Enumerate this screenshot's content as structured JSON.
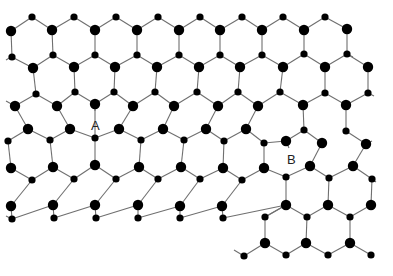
{
  "figure": {
    "type": "hexagonal-lattice-with-dislocations",
    "width": 393,
    "height": 276,
    "background": "#ffffff",
    "bond_color": "#6f6f6f",
    "atom_color": "#000000",
    "atom_radius_large": 5.2,
    "atom_radius_small": 3.6
  },
  "labels": [
    {
      "id": "A",
      "text": "A",
      "x": 91,
      "y": 130
    },
    {
      "id": "B",
      "text": "B",
      "x": 287,
      "y": 164
    }
  ],
  "atoms": [
    {
      "id": "r0a",
      "x": 32,
      "y": 17,
      "size": "small"
    },
    {
      "id": "r0b",
      "x": 74,
      "y": 17,
      "size": "small"
    },
    {
      "id": "r0c",
      "x": 116,
      "y": 17,
      "size": "small"
    },
    {
      "id": "r0d",
      "x": 158,
      "y": 17,
      "size": "small"
    },
    {
      "id": "r0e",
      "x": 200,
      "y": 17,
      "size": "small"
    },
    {
      "id": "r0f",
      "x": 242,
      "y": 17,
      "size": "small"
    },
    {
      "id": "r0g",
      "x": 283,
      "y": 17,
      "size": "small"
    },
    {
      "id": "r0h",
      "x": 325,
      "y": 17,
      "size": "small"
    },
    {
      "id": "r1a",
      "x": 11,
      "y": 31,
      "size": "large"
    },
    {
      "id": "r1b",
      "x": 52,
      "y": 30,
      "size": "large"
    },
    {
      "id": "r1c",
      "x": 95,
      "y": 30,
      "size": "large"
    },
    {
      "id": "r1d",
      "x": 137,
      "y": 30,
      "size": "large"
    },
    {
      "id": "r1e",
      "x": 179,
      "y": 30,
      "size": "large"
    },
    {
      "id": "r1f",
      "x": 220,
      "y": 30,
      "size": "large"
    },
    {
      "id": "r1g",
      "x": 262,
      "y": 30,
      "size": "large"
    },
    {
      "id": "r1h",
      "x": 304,
      "y": 30,
      "size": "large"
    },
    {
      "id": "r1i",
      "x": 347,
      "y": 29,
      "size": "large"
    },
    {
      "id": "r2a",
      "x": 12,
      "y": 57,
      "size": "small"
    },
    {
      "id": "r2b",
      "x": 53,
      "y": 55,
      "size": "small"
    },
    {
      "id": "r2c",
      "x": 95,
      "y": 55,
      "size": "small"
    },
    {
      "id": "r2d",
      "x": 137,
      "y": 55,
      "size": "small"
    },
    {
      "id": "r2e",
      "x": 179,
      "y": 55,
      "size": "small"
    },
    {
      "id": "r2f",
      "x": 220,
      "y": 55,
      "size": "small"
    },
    {
      "id": "r2g",
      "x": 262,
      "y": 55,
      "size": "small"
    },
    {
      "id": "r2h",
      "x": 304,
      "y": 54,
      "size": "small"
    },
    {
      "id": "r2i",
      "x": 347,
      "y": 54,
      "size": "small"
    },
    {
      "id": "r3a",
      "x": 33,
      "y": 68,
      "size": "large"
    },
    {
      "id": "r3b",
      "x": 74,
      "y": 67,
      "size": "large"
    },
    {
      "id": "r3c",
      "x": 115,
      "y": 67,
      "size": "large"
    },
    {
      "id": "r3d",
      "x": 157,
      "y": 67,
      "size": "large"
    },
    {
      "id": "r3e",
      "x": 199,
      "y": 67,
      "size": "large"
    },
    {
      "id": "r3f",
      "x": 240,
      "y": 67,
      "size": "large"
    },
    {
      "id": "r3g",
      "x": 283,
      "y": 67,
      "size": "large"
    },
    {
      "id": "r3h",
      "x": 325,
      "y": 67,
      "size": "large"
    },
    {
      "id": "r3i",
      "x": 368,
      "y": 67,
      "size": "large"
    },
    {
      "id": "r4a",
      "x": 36,
      "y": 94,
      "size": "small"
    },
    {
      "id": "r4b",
      "x": 75,
      "y": 92,
      "size": "small"
    },
    {
      "id": "r4c",
      "x": 114,
      "y": 92,
      "size": "small"
    },
    {
      "id": "r4d",
      "x": 155,
      "y": 92,
      "size": "small"
    },
    {
      "id": "r4e",
      "x": 197,
      "y": 92,
      "size": "small"
    },
    {
      "id": "r4f",
      "x": 238,
      "y": 92,
      "size": "small"
    },
    {
      "id": "r4g",
      "x": 280,
      "y": 92,
      "size": "small"
    },
    {
      "id": "r4h",
      "x": 325,
      "y": 93,
      "size": "small"
    },
    {
      "id": "r4i",
      "x": 368,
      "y": 93,
      "size": "small"
    },
    {
      "id": "r5a",
      "x": 15,
      "y": 106,
      "size": "large"
    },
    {
      "id": "r5b",
      "x": 57,
      "y": 106,
      "size": "large"
    },
    {
      "id": "r5c",
      "x": 95,
      "y": 104,
      "size": "large"
    },
    {
      "id": "r5d",
      "x": 133,
      "y": 106,
      "size": "large"
    },
    {
      "id": "r5e",
      "x": 174,
      "y": 106,
      "size": "large"
    },
    {
      "id": "r5f",
      "x": 218,
      "y": 106,
      "size": "large"
    },
    {
      "id": "r5g",
      "x": 258,
      "y": 106,
      "size": "large"
    },
    {
      "id": "r5h",
      "x": 303,
      "y": 105,
      "size": "large"
    },
    {
      "id": "r5i",
      "x": 346,
      "y": 105,
      "size": "large"
    },
    {
      "id": "r6a",
      "x": 8,
      "y": 141,
      "size": "small"
    },
    {
      "id": "r6b",
      "x": 50,
      "y": 140,
      "size": "small"
    },
    {
      "id": "r6c",
      "x": 95,
      "y": 138,
      "size": "small"
    },
    {
      "id": "r6d",
      "x": 141,
      "y": 140,
      "size": "small"
    },
    {
      "id": "r6e",
      "x": 184,
      "y": 140,
      "size": "small"
    },
    {
      "id": "r6f",
      "x": 224,
      "y": 141,
      "size": "small"
    },
    {
      "id": "r6g",
      "x": 264,
      "y": 143,
      "size": "small"
    },
    {
      "id": "r6h",
      "x": 304,
      "y": 130,
      "size": "small"
    },
    {
      "id": "r6i",
      "x": 346,
      "y": 131,
      "size": "small"
    },
    {
      "id": "r7a",
      "x": 28,
      "y": 129,
      "size": "large"
    },
    {
      "id": "r7b",
      "x": 70,
      "y": 129,
      "size": "large"
    },
    {
      "id": "r7c",
      "x": 119,
      "y": 129,
      "size": "large"
    },
    {
      "id": "r7d",
      "x": 163,
      "y": 129,
      "size": "large"
    },
    {
      "id": "r7e",
      "x": 206,
      "y": 129,
      "size": "large"
    },
    {
      "id": "r7f",
      "x": 246,
      "y": 129,
      "size": "large"
    },
    {
      "id": "r7g",
      "x": 286,
      "y": 141,
      "size": "large"
    },
    {
      "id": "r7h",
      "x": 322,
      "y": 143,
      "size": "large"
    },
    {
      "id": "r7i",
      "x": 366,
      "y": 144,
      "size": "large"
    },
    {
      "id": "r8a",
      "x": 11,
      "y": 168,
      "size": "large"
    },
    {
      "id": "r8b",
      "x": 53,
      "y": 167,
      "size": "large"
    },
    {
      "id": "r8c",
      "x": 95,
      "y": 165,
      "size": "large"
    },
    {
      "id": "r8d",
      "x": 139,
      "y": 167,
      "size": "large"
    },
    {
      "id": "r8e",
      "x": 181,
      "y": 167,
      "size": "large"
    },
    {
      "id": "r8f",
      "x": 223,
      "y": 168,
      "size": "large"
    },
    {
      "id": "r8g",
      "x": 264,
      "y": 168,
      "size": "large"
    },
    {
      "id": "r8h",
      "x": 310,
      "y": 166,
      "size": "large"
    },
    {
      "id": "r8i",
      "x": 353,
      "y": 166,
      "size": "large"
    },
    {
      "id": "r9a",
      "x": 32,
      "y": 180,
      "size": "small"
    },
    {
      "id": "r9b",
      "x": 74,
      "y": 179,
      "size": "small"
    },
    {
      "id": "r9c",
      "x": 116,
      "y": 179,
      "size": "small"
    },
    {
      "id": "r9d",
      "x": 158,
      "y": 179,
      "size": "small"
    },
    {
      "id": "r9e",
      "x": 200,
      "y": 179,
      "size": "small"
    },
    {
      "id": "r9f",
      "x": 242,
      "y": 180,
      "size": "small"
    },
    {
      "id": "r9g",
      "x": 286,
      "y": 177,
      "size": "small"
    },
    {
      "id": "r9h",
      "x": 329,
      "y": 178,
      "size": "small"
    },
    {
      "id": "r9i",
      "x": 372,
      "y": 179,
      "size": "small"
    },
    {
      "id": "r10a",
      "x": 11,
      "y": 206,
      "size": "large"
    },
    {
      "id": "r10b",
      "x": 53,
      "y": 205,
      "size": "large"
    },
    {
      "id": "r10c",
      "x": 95,
      "y": 205,
      "size": "large"
    },
    {
      "id": "r10d",
      "x": 138,
      "y": 205,
      "size": "large"
    },
    {
      "id": "r10e",
      "x": 180,
      "y": 206,
      "size": "large"
    },
    {
      "id": "r10f",
      "x": 222,
      "y": 206,
      "size": "large"
    },
    {
      "id": "r10g",
      "x": 286,
      "y": 205,
      "size": "large"
    },
    {
      "id": "r10h",
      "x": 328,
      "y": 205,
      "size": "large"
    },
    {
      "id": "r10i",
      "x": 371,
      "y": 205,
      "size": "large"
    },
    {
      "id": "r11a",
      "x": 12,
      "y": 219,
      "size": "small"
    },
    {
      "id": "r11b",
      "x": 54,
      "y": 218,
      "size": "small"
    },
    {
      "id": "r11c",
      "x": 96,
      "y": 218,
      "size": "small"
    },
    {
      "id": "r11d",
      "x": 138,
      "y": 218,
      "size": "small"
    },
    {
      "id": "r11e",
      "x": 180,
      "y": 218,
      "size": "small"
    },
    {
      "id": "r11f",
      "x": 223,
      "y": 218,
      "size": "small"
    },
    {
      "id": "r11g",
      "x": 265,
      "y": 217,
      "size": "small"
    },
    {
      "id": "r11h",
      "x": 307,
      "y": 217,
      "size": "small"
    },
    {
      "id": "r11i",
      "x": 350,
      "y": 217,
      "size": "small"
    },
    {
      "id": "r12a",
      "x": 265,
      "y": 243,
      "size": "large"
    },
    {
      "id": "r12b",
      "x": 306,
      "y": 243,
      "size": "large"
    },
    {
      "id": "r12c",
      "x": 350,
      "y": 243,
      "size": "large"
    },
    {
      "id": "r13a",
      "x": 244,
      "y": 256,
      "size": "small"
    },
    {
      "id": "r13b",
      "x": 286,
      "y": 255,
      "size": "small"
    },
    {
      "id": "r13c",
      "x": 328,
      "y": 255,
      "size": "small"
    },
    {
      "id": "r13d",
      "x": 371,
      "y": 255,
      "size": "small"
    }
  ],
  "bonds": [
    [
      "r1a",
      "r0a"
    ],
    [
      "r0a",
      "r1b"
    ],
    [
      "r1b",
      "r0b"
    ],
    [
      "r0b",
      "r1c"
    ],
    [
      "r1c",
      "r0c"
    ],
    [
      "r0c",
      "r1d"
    ],
    [
      "r1d",
      "r0d"
    ],
    [
      "r0d",
      "r1e"
    ],
    [
      "r1e",
      "r0e"
    ],
    [
      "r0e",
      "r1f"
    ],
    [
      "r1f",
      "r0f"
    ],
    [
      "r0f",
      "r1g"
    ],
    [
      "r1g",
      "r0g"
    ],
    [
      "r0g",
      "r1h"
    ],
    [
      "r1h",
      "r0h"
    ],
    [
      "r0h",
      "r1i"
    ],
    [
      "r1a",
      "r2a"
    ],
    [
      "r1b",
      "r2b"
    ],
    [
      "r1c",
      "r2c"
    ],
    [
      "r1d",
      "r2d"
    ],
    [
      "r1e",
      "r2e"
    ],
    [
      "r1f",
      "r2f"
    ],
    [
      "r1g",
      "r2g"
    ],
    [
      "r1h",
      "r2h"
    ],
    [
      "r1i",
      "r2i"
    ],
    [
      "r2a",
      "r3a"
    ],
    [
      "r3a",
      "r2b"
    ],
    [
      "r2b",
      "r3b"
    ],
    [
      "r3b",
      "r2c"
    ],
    [
      "r2c",
      "r3c"
    ],
    [
      "r3c",
      "r2d"
    ],
    [
      "r2d",
      "r3d"
    ],
    [
      "r3d",
      "r2e"
    ],
    [
      "r2e",
      "r3e"
    ],
    [
      "r3e",
      "r2f"
    ],
    [
      "r2f",
      "r3f"
    ],
    [
      "r3f",
      "r2g"
    ],
    [
      "r2g",
      "r3g"
    ],
    [
      "r3g",
      "r2h"
    ],
    [
      "r2h",
      "r3h"
    ],
    [
      "r3h",
      "r2i"
    ],
    [
      "r2i",
      "r3i"
    ],
    [
      "r3a",
      "r4a"
    ],
    [
      "r3b",
      "r4b"
    ],
    [
      "r3c",
      "r4c"
    ],
    [
      "r3d",
      "r4d"
    ],
    [
      "r3e",
      "r4e"
    ],
    [
      "r3f",
      "r4f"
    ],
    [
      "r3g",
      "r4g"
    ],
    [
      "r3h",
      "r4h"
    ],
    [
      "r3i",
      "r4i"
    ],
    [
      "r5a",
      "r4a"
    ],
    [
      "r4a",
      "r5b"
    ],
    [
      "r5b",
      "r4b"
    ],
    [
      "r4b",
      "r5c"
    ],
    [
      "r5c",
      "r4c"
    ],
    [
      "r4c",
      "r5d"
    ],
    [
      "r5d",
      "r4d"
    ],
    [
      "r4d",
      "r5e"
    ],
    [
      "r5e",
      "r4e"
    ],
    [
      "r4e",
      "r5f"
    ],
    [
      "r5f",
      "r4f"
    ],
    [
      "r4f",
      "r5g"
    ],
    [
      "r5g",
      "r4g"
    ],
    [
      "r4g",
      "r5h"
    ],
    [
      "r5h",
      "r4h"
    ],
    [
      "r4h",
      "r5i"
    ],
    [
      "r5i",
      "r4i"
    ],
    [
      "r5a",
      "r7a"
    ],
    [
      "r5b",
      "r7b"
    ],
    [
      "r5d",
      "r7c"
    ],
    [
      "r5e",
      "r7d"
    ],
    [
      "r5f",
      "r7e"
    ],
    [
      "r5g",
      "r7f"
    ],
    [
      "r5h",
      "r6h"
    ],
    [
      "r5i",
      "r6i"
    ],
    [
      "r5c",
      "r6c"
    ],
    [
      "r6a",
      "r7a"
    ],
    [
      "r7a",
      "r6b"
    ],
    [
      "r6b",
      "r7b"
    ],
    [
      "r7b",
      "r6c"
    ],
    [
      "r6c",
      "r7c"
    ],
    [
      "r7c",
      "r6d"
    ],
    [
      "r6d",
      "r7d"
    ],
    [
      "r7d",
      "r6e"
    ],
    [
      "r6e",
      "r7e"
    ],
    [
      "r7e",
      "r6f"
    ],
    [
      "r6f",
      "r7f"
    ],
    [
      "r7f",
      "r6g"
    ],
    [
      "r6g",
      "r7g"
    ],
    [
      "r6h",
      "r7h"
    ],
    [
      "r6i",
      "r7i"
    ],
    [
      "r6h",
      "r7g"
    ],
    [
      "r6a",
      "r8a"
    ],
    [
      "r6b",
      "r8b"
    ],
    [
      "r6c",
      "r8c"
    ],
    [
      "r6d",
      "r8d"
    ],
    [
      "r6e",
      "r8e"
    ],
    [
      "r6f",
      "r8f"
    ],
    [
      "r6g",
      "r8g"
    ],
    [
      "r7h",
      "r8h"
    ],
    [
      "r7i",
      "r8i"
    ],
    [
      "r8a",
      "r9a"
    ],
    [
      "r9a",
      "r8b"
    ],
    [
      "r8b",
      "r9b"
    ],
    [
      "r9b",
      "r8c"
    ],
    [
      "r8c",
      "r9c"
    ],
    [
      "r9c",
      "r8d"
    ],
    [
      "r8d",
      "r9d"
    ],
    [
      "r9d",
      "r8e"
    ],
    [
      "r8e",
      "r9e"
    ],
    [
      "r9e",
      "r8f"
    ],
    [
      "r8f",
      "r9f"
    ],
    [
      "r9f",
      "r8g"
    ],
    [
      "r8g",
      "r9g"
    ],
    [
      "r9g",
      "r8h"
    ],
    [
      "r8h",
      "r9h"
    ],
    [
      "r9h",
      "r8i"
    ],
    [
      "r8i",
      "r9i"
    ],
    [
      "r9a",
      "r10a"
    ],
    [
      "r9b",
      "r10b"
    ],
    [
      "r9c",
      "r10c"
    ],
    [
      "r9d",
      "r10d"
    ],
    [
      "r9e",
      "r10e"
    ],
    [
      "r9f",
      "r10f"
    ],
    [
      "r9g",
      "r10g"
    ],
    [
      "r9h",
      "r10h"
    ],
    [
      "r9i",
      "r10i"
    ],
    [
      "r10a",
      "r11a"
    ],
    [
      "r11a",
      "r10b"
    ],
    [
      "r10b",
      "r11b"
    ],
    [
      "r11b",
      "r10c"
    ],
    [
      "r10c",
      "r11c"
    ],
    [
      "r11c",
      "r10d"
    ],
    [
      "r10d",
      "r11d"
    ],
    [
      "r11d",
      "r10e"
    ],
    [
      "r10e",
      "r11e"
    ],
    [
      "r11e",
      "r10f"
    ],
    [
      "r10f",
      "r11f"
    ],
    [
      "r11f",
      "r10g"
    ],
    [
      "r10g",
      "r11g"
    ],
    [
      "r11g",
      "r10g"
    ],
    [
      "r10g",
      "r11h"
    ],
    [
      "r11h",
      "r10h"
    ],
    [
      "r10h",
      "r11i"
    ],
    [
      "r11i",
      "r10i"
    ],
    [
      "r11g",
      "r12a"
    ],
    [
      "r11h",
      "r12b"
    ],
    [
      "r11i",
      "r12c"
    ],
    [
      "r13a",
      "r12a"
    ],
    [
      "r12a",
      "r13b"
    ],
    [
      "r13b",
      "r12b"
    ],
    [
      "r12b",
      "r13c"
    ],
    [
      "r13c",
      "r12c"
    ],
    [
      "r12c",
      "r13d"
    ]
  ],
  "stub_bonds": [
    {
      "x1": 11,
      "y1": 57,
      "x2": 6,
      "y2": 60
    },
    {
      "x1": 15,
      "y1": 106,
      "x2": 6,
      "y2": 101
    },
    {
      "x1": 347,
      "y1": 54,
      "x2": 353,
      "y2": 57
    },
    {
      "x1": 368,
      "y1": 93,
      "x2": 374,
      "y2": 96
    },
    {
      "x1": 366,
      "y1": 144,
      "x2": 372,
      "y2": 141
    },
    {
      "x1": 372,
      "y1": 179,
      "x2": 376,
      "y2": 182
    },
    {
      "x1": 12,
      "y1": 219,
      "x2": 6,
      "y2": 216
    },
    {
      "x1": 244,
      "y1": 256,
      "x2": 234,
      "y2": 250
    },
    {
      "x1": 95,
      "y1": 104,
      "x2": 95,
      "y2": 111
    },
    {
      "x1": 286,
      "y1": 141,
      "x2": 289,
      "y2": 148
    }
  ]
}
